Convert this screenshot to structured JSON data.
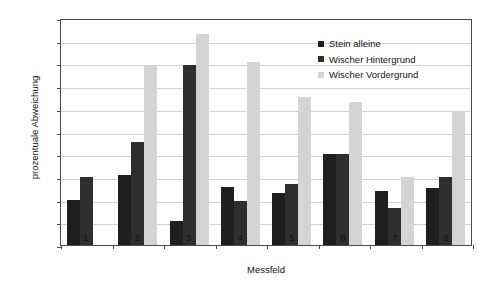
{
  "chart_data": {
    "type": "bar",
    "title": "",
    "xlabel": "Messfeld",
    "ylabel": "prozentuale Abweichung",
    "categories": [
      "1",
      "2",
      "3",
      "4",
      "5",
      "6",
      "7",
      "8"
    ],
    "ylim": [
      0,
      20
    ],
    "ytick_step": 2,
    "ytick_labels": [
      "0,00",
      "2,00",
      "4,00",
      "6,00",
      "8,00",
      "10,00",
      "12,00",
      "14,00",
      "16,00",
      "18,00",
      "20,00"
    ],
    "grid": true,
    "legend_position": "top-right",
    "series": [
      {
        "name": "Stein alleine",
        "color": "#1f1f1f",
        "values": [
          4.0,
          6.2,
          2.1,
          5.1,
          4.6,
          8.0,
          4.8,
          5.0
        ]
      },
      {
        "name": "Wischer Hintergrund",
        "color": "#2e2e2e",
        "values": [
          6.0,
          9.1,
          15.9,
          3.9,
          5.4,
          8.0,
          3.3,
          6.0
        ]
      },
      {
        "name": "Wischer Vordergrund",
        "color": "#d4d4d4",
        "values": [
          0.0,
          15.9,
          18.6,
          16.1,
          13.0,
          12.6,
          6.0,
          11.7
        ]
      }
    ]
  }
}
